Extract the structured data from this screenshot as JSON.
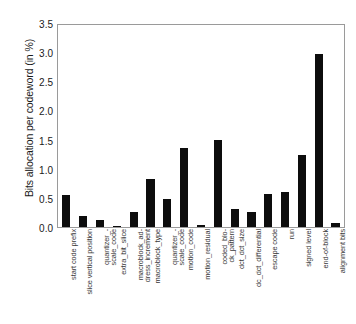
{
  "chart_data": {
    "type": "bar",
    "title": "",
    "xlabel": "",
    "ylabel": "Bits allocation per codeword (in %)",
    "ylim": [
      0,
      3.5
    ],
    "yticks": [
      "0.0",
      "0.5",
      "1.0",
      "1.5",
      "2.0",
      "2.5",
      "3.0",
      "3.5"
    ],
    "ytick_values": [
      0.0,
      0.5,
      1.0,
      1.5,
      2.0,
      2.5,
      3.0,
      3.5
    ],
    "grid": false,
    "legend": null,
    "bar_color": "#0d0d0d",
    "categories": [
      "start code prefix",
      "slice vertical position",
      "quantizer_scale_code",
      "extra_bit_slice",
      "macroblock_address_increment",
      "macroblock_type",
      "quantizer_scale_code",
      "motion_code",
      "motion_residual",
      "coded_block_pattern",
      "dct_dct_size",
      "dc_dct_differential",
      "escape code",
      "run",
      "signed level",
      "end-of-block",
      "alignment bits"
    ],
    "category_lines": [
      [
        "start code prefix",
        ""
      ],
      [
        "slice vertical position",
        ""
      ],
      [
        "quantizer_-",
        "scale_code"
      ],
      [
        "extra_bit_slice",
        ""
      ],
      [
        "macroblock_ad-",
        "dress_increment"
      ],
      [
        "macroblock_type",
        ""
      ],
      [
        "quantizer_-",
        "scale_code"
      ],
      [
        "motion_code",
        ""
      ],
      [
        "motion_residual",
        ""
      ],
      [
        "coded_blo-",
        "ck_pattern"
      ],
      [
        "dct_dct_size",
        ""
      ],
      [
        "dc_dct_differential",
        ""
      ],
      [
        "escape code",
        ""
      ],
      [
        "run",
        ""
      ],
      [
        "signed level",
        ""
      ],
      [
        "end-of-block",
        ""
      ],
      [
        "alignment bits",
        ""
      ]
    ],
    "values": [
      0.55,
      0.19,
      0.12,
      0.02,
      0.26,
      0.84,
      0.48,
      1.37,
      0.03,
      1.51,
      0.32,
      0.26,
      0.58,
      0.6,
      1.24,
      3.0,
      0.07
    ]
  }
}
